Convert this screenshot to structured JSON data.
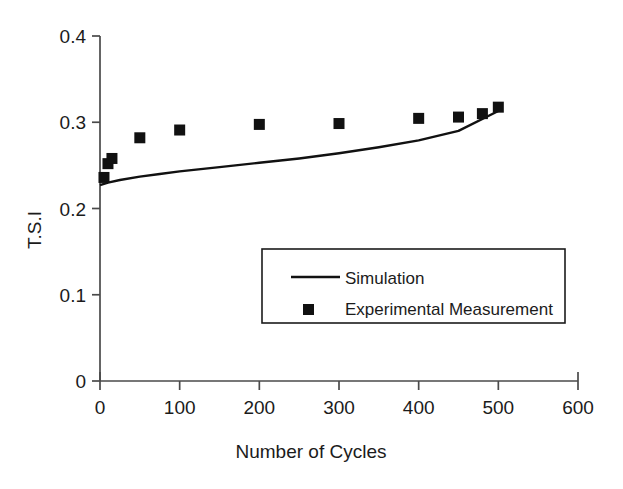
{
  "chart_data": {
    "type": "scatter",
    "title": "",
    "xlabel": "Number of  Cycles",
    "ylabel": "T.S.I",
    "xlim": [
      0,
      600
    ],
    "ylim": [
      0,
      0.4
    ],
    "xticks": [
      "0",
      "100",
      "200",
      "300",
      "400",
      "500",
      "600"
    ],
    "xtick_values": [
      0,
      100,
      200,
      300,
      400,
      500,
      600
    ],
    "yticks": [
      "0",
      "0.1",
      "0.2",
      "0.3",
      "0.4"
    ],
    "ytick_values": [
      0,
      0.1,
      0.2,
      0.3,
      0.4
    ],
    "grid": false,
    "legend_position": "center",
    "series": [
      {
        "name": "Simulation",
        "marker": "line",
        "color": "#111111",
        "x": [
          0,
          10,
          25,
          50,
          75,
          100,
          150,
          200,
          250,
          300,
          350,
          400,
          450,
          500
        ],
        "values": [
          0.227,
          0.23,
          0.233,
          0.237,
          0.24,
          0.243,
          0.248,
          0.253,
          0.258,
          0.264,
          0.271,
          0.279,
          0.29,
          0.313
        ]
      },
      {
        "name": "Experimental Measurement",
        "marker": "square",
        "color": "#111111",
        "x": [
          5,
          10,
          15,
          50,
          100,
          200,
          300,
          400,
          450,
          480,
          500
        ],
        "values": [
          0.236,
          0.252,
          0.258,
          0.282,
          0.291,
          0.2975,
          0.2985,
          0.3045,
          0.306,
          0.31,
          0.3175
        ]
      }
    ]
  },
  "legend": {
    "entries": [
      {
        "label": "Simulation",
        "symbol": "line-swatch"
      },
      {
        "label": "Experimental Measurement",
        "symbol": "square-swatch"
      }
    ]
  },
  "colors": {
    "series": "#111111",
    "axis": "#4a4a4a",
    "text": "#1b1b1b",
    "background": "#ffffff"
  }
}
